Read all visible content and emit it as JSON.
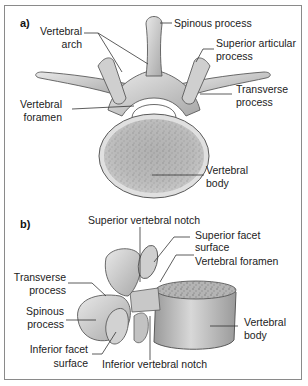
{
  "figure": {
    "panel_a": {
      "letter": "a)",
      "view": "superior view",
      "labels": {
        "spinous_process": "Spinous process",
        "vertebral_arch_1": "Vertebral",
        "vertebral_arch_2": "arch",
        "superior_articular_1": "Superior articular",
        "superior_articular_2": "process",
        "transverse_1": "Transverse",
        "transverse_2": "process",
        "vertebral_foramen_1": "Vertebral",
        "vertebral_foramen_2": "foramen",
        "vertebral_body_1": "Vertebral",
        "vertebral_body_2": "body"
      }
    },
    "panel_b": {
      "letter": "b)",
      "view": "lateral view",
      "labels": {
        "superior_notch": "Superior vertebral notch",
        "superior_facet_1": "Superior facet",
        "superior_facet_2": "surface",
        "vertebral_foramen": "Vertebral foramen",
        "transverse_1": "Transverse",
        "transverse_2": "process",
        "spinous_1": "Spinous",
        "spinous_2": "process",
        "inferior_facet_1": "Inferior facet",
        "inferior_facet_2": "surface",
        "inferior_notch": "Inferior vertebral notch",
        "vertebral_body_1": "Vertebral",
        "vertebral_body_2": "body"
      }
    },
    "colors": {
      "bone_fill": "#d9d9d9",
      "bone_shadow": "#9a9a9a",
      "bone_outline": "#5a5a5a",
      "cancellous": "#a8a8a8",
      "leader_line": "#333333",
      "frame": "#8a8a8a"
    }
  }
}
